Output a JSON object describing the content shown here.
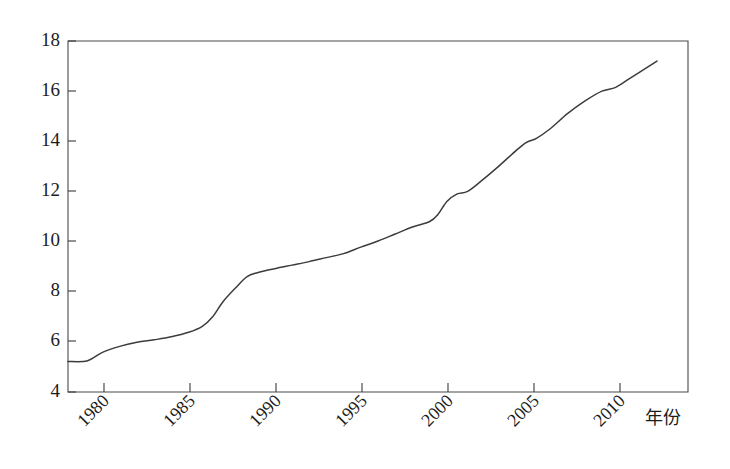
{
  "chart_data": {
    "type": "line",
    "title": "",
    "subtitle": "",
    "xlabel": "年份",
    "ylabel": "",
    "xlim": [
      1979,
      2015
    ],
    "ylim": [
      4,
      18
    ],
    "grid": false,
    "legend": "none",
    "x_tick_labels": [
      "1980",
      "1985",
      "1990",
      "1995",
      "2000",
      "2005",
      "2010"
    ],
    "x_ticks": [
      1980,
      1985,
      1990,
      1995,
      2000,
      2005,
      2010
    ],
    "y_tick_labels": [
      "4",
      "6",
      "8",
      "10",
      "12",
      "14",
      "16",
      "18"
    ],
    "y_ticks": [
      4,
      6,
      8,
      10,
      12,
      14,
      16,
      18
    ],
    "x_tick_rotation_deg": -45,
    "series": [
      {
        "name": "series-1",
        "color": "#3c3c3c",
        "x": [
          1979.0,
          1980.1,
          1981.0,
          1982.0,
          1983.0,
          1984.0,
          1985.0,
          1986.0,
          1986.8,
          1987.4,
          1988.0,
          1988.8,
          1989.4,
          1990.0,
          1991.0,
          1992.0,
          1993.0,
          1994.0,
          1995.0,
          1996.0,
          1997.0,
          1998.0,
          1999.0,
          2000.0,
          2000.5,
          2001.0,
          2001.6,
          2002.2,
          2003.0,
          2004.0,
          2005.0,
          2005.6,
          2006.2,
          2007.0,
          2008.0,
          2009.0,
          2010.0,
          2010.8,
          2011.6,
          2012.4,
          2013.2
        ],
        "y": [
          5.22,
          5.24,
          5.58,
          5.82,
          5.98,
          6.08,
          6.2,
          6.38,
          6.62,
          7.0,
          7.6,
          8.2,
          8.6,
          8.76,
          8.92,
          9.06,
          9.2,
          9.36,
          9.52,
          9.78,
          10.02,
          10.3,
          10.58,
          10.8,
          11.1,
          11.6,
          11.9,
          12.0,
          12.42,
          13.0,
          13.62,
          13.95,
          14.12,
          14.5,
          15.1,
          15.6,
          16.0,
          16.15,
          16.5,
          16.85,
          17.2
        ]
      }
    ]
  },
  "axes": {
    "left_label_ids": [
      "18",
      "16",
      "14",
      "12",
      "10",
      "8",
      "6",
      "4"
    ],
    "bottom_label_ids": [
      "1980",
      "1985",
      "1990",
      "1995",
      "2000",
      "2005",
      "2010"
    ],
    "x_axis_title": "年份"
  }
}
